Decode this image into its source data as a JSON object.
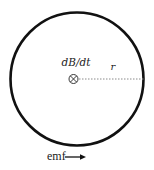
{
  "diagram": {
    "field_label": "dB/dt",
    "field_symbol": "into-page-icon",
    "radius_label": "r",
    "emf_label": "emf",
    "emf_arrow": "right-arrow-icon",
    "colors": {
      "stroke": "#111111",
      "dotted": "#8a8a8a",
      "background": "#ffffff"
    }
  }
}
